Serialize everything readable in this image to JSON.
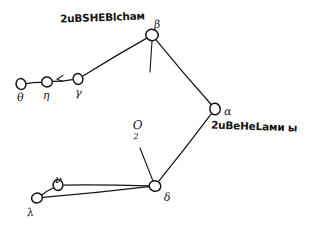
{
  "canvas": {
    "width": 324,
    "height": 227,
    "background": "#ffffff",
    "ink_color": "#171512",
    "description": "hand-drawn-graph-sketch"
  },
  "annotations": [
    {
      "id": "top-annotation",
      "text": "2uBSHEBlchaм",
      "x": 60,
      "y": 12
    },
    {
      "id": "alpha-annotation",
      "text": "2uBeHeLaми ы",
      "x": 211,
      "y": 121
    }
  ],
  "origin": {
    "label": "O",
    "subscript": "2",
    "x": 133,
    "y": 119
  },
  "nodes": [
    {
      "id": "theta",
      "label": "θ",
      "cx": 21,
      "cy": 84,
      "r": 5.2,
      "label_dx": -4,
      "label_dy": 8
    },
    {
      "id": "eta",
      "label": "η",
      "cx": 47,
      "cy": 82,
      "r": 5.2,
      "label_dx": -4,
      "label_dy": 8
    },
    {
      "id": "gamma",
      "label": "γ",
      "cx": 78,
      "cy": 79,
      "r": 5.2,
      "label_dx": -3,
      "label_dy": 8
    },
    {
      "id": "beta",
      "label": "β",
      "cx": 152,
      "cy": 35,
      "r": 6.0,
      "label_dx": 2,
      "label_dy": -16
    },
    {
      "id": "alpha",
      "label": "α",
      "cx": 215,
      "cy": 109,
      "r": 5.6,
      "label_dx": 9,
      "label_dy": -3
    },
    {
      "id": "delta",
      "label": "δ",
      "cx": 155,
      "cy": 186,
      "r": 5.6,
      "label_dx": 9,
      "label_dy": 6
    },
    {
      "id": "nu",
      "label": "ν",
      "cx": 58,
      "cy": 185,
      "r": 5.2,
      "label_dx": -3,
      "label_dy": -11
    },
    {
      "id": "lam",
      "label": "λ",
      "cx": 37,
      "cy": 198,
      "r": 5.2,
      "label_dx": -10,
      "label_dy": 9
    }
  ],
  "edges": [
    {
      "id": "theta-eta",
      "from": "theta",
      "to": "eta"
    },
    {
      "id": "eta-gamma",
      "from": "eta",
      "to": "gamma"
    },
    {
      "id": "gamma-beta",
      "from": "gamma",
      "to": "beta"
    },
    {
      "id": "beta-alpha",
      "from": "beta",
      "to": "alpha"
    },
    {
      "id": "alpha-delta",
      "from": "alpha",
      "to": "delta"
    },
    {
      "id": "delta-nu",
      "from": "delta",
      "to": "nu"
    },
    {
      "id": "delta-lam",
      "from": "delta",
      "to": "lam"
    },
    {
      "id": "nu-lam",
      "from": "nu",
      "to": "lam"
    }
  ],
  "ticks": [
    {
      "id": "beta-tick",
      "x1": 152,
      "y1": 41,
      "x2": 150,
      "y2": 72
    },
    {
      "id": "origin-tick",
      "x1": 140,
      "y1": 148,
      "x2": 153,
      "y2": 181
    }
  ],
  "arrow_marks": [
    {
      "id": "eta-gamma-arrow",
      "x": 58,
      "y": 78
    }
  ]
}
